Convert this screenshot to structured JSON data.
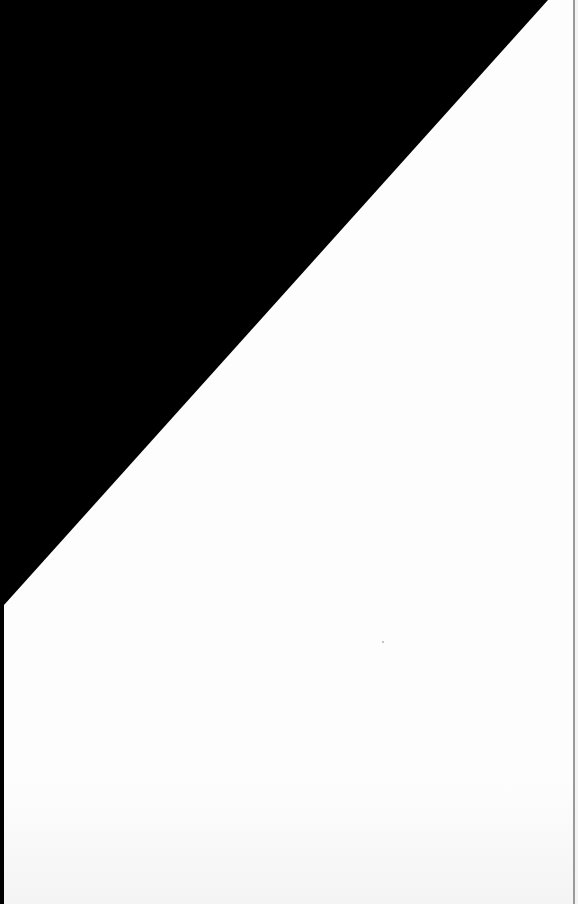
{
  "scene": {
    "description": "Angled blank white sheet of paper over a black background",
    "colors": {
      "background": "#000000",
      "paper": "#fdfdfd",
      "edge": "#9a9a9a"
    },
    "text": []
  }
}
